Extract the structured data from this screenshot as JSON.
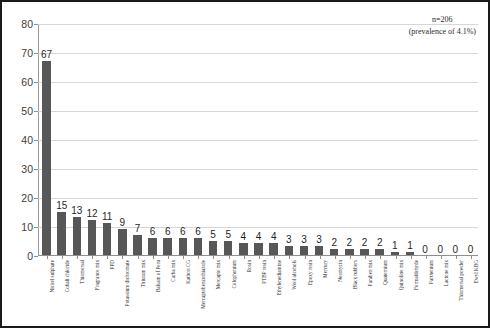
{
  "annotation": {
    "sample_size": "n=206",
    "prevalence": "(prevalence of 4.1%)"
  },
  "chart_data": {
    "type": "bar",
    "title": "",
    "xlabel": "",
    "ylabel": "",
    "ylim": [
      0,
      80
    ],
    "yticks": [
      0,
      10,
      20,
      30,
      40,
      50,
      60,
      70,
      80
    ],
    "grid": true,
    "legend": false,
    "bar_color": "#575757",
    "categories": [
      "Nickel sulphate",
      "Cobalt chloride",
      "Thiomersal",
      "Fragrance mix",
      "PPD",
      "Potassium dichromate",
      "Thiuram mix",
      "Balsam of Peru",
      "Carba mix",
      "Kathon CG",
      "Mercaptobenzothiazole",
      "Mercapto mix",
      "Colophonium",
      "Rosin",
      "PTBP resin",
      "Ethylenediamine",
      "Wool alcohols",
      "Epoxy resin",
      "Mercury",
      "Neomycin",
      "Black rubbers",
      "Paraben mix",
      "Quaternium",
      "Quinoline mix",
      "Formaldehyde",
      "Parthenium",
      "Lactone mix",
      "Thiomersal powder",
      "Ewyl KBG"
    ],
    "values": [
      67,
      15,
      13,
      12,
      11,
      9,
      7,
      6,
      6,
      6,
      6,
      5,
      5,
      4,
      4,
      4,
      3,
      3,
      3,
      2,
      2,
      2,
      2,
      1,
      1,
      0,
      0,
      0,
      0
    ]
  }
}
